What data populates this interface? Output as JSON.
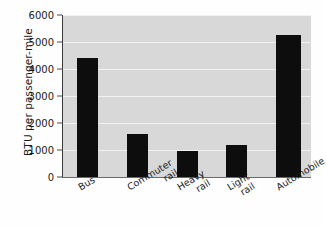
{
  "chart_data": {
    "type": "bar",
    "title": "",
    "subtitle": "",
    "xlabel": "",
    "ylabel": "BTU per passenger-mile",
    "categories": [
      "Bus",
      "Commuter rail",
      "Heavy rail",
      "Light rail",
      "Automobile"
    ],
    "category_lines": [
      [
        "Bus"
      ],
      [
        "Commuter",
        "rail"
      ],
      [
        "Heavy",
        "rail"
      ],
      [
        "Light",
        "rail"
      ],
      [
        "Automobile"
      ]
    ],
    "values": [
      4400,
      1600,
      950,
      1200,
      5250
    ],
    "ylim": [
      0,
      6000
    ],
    "yticks": [
      0,
      1000,
      2000,
      3000,
      4000,
      5000,
      6000
    ],
    "ytick_labels": [
      "0",
      "1000",
      "2000",
      "3000",
      "4000",
      "5000",
      "6000"
    ],
    "grid": true,
    "grid_axis": "y",
    "legend": null,
    "legend_position": "none",
    "bar_color": "#0d0d0d",
    "plot_background": "#d8d8d8",
    "gridline_color": "#f2f2f2",
    "axis_color": "#3a3a3a"
  }
}
